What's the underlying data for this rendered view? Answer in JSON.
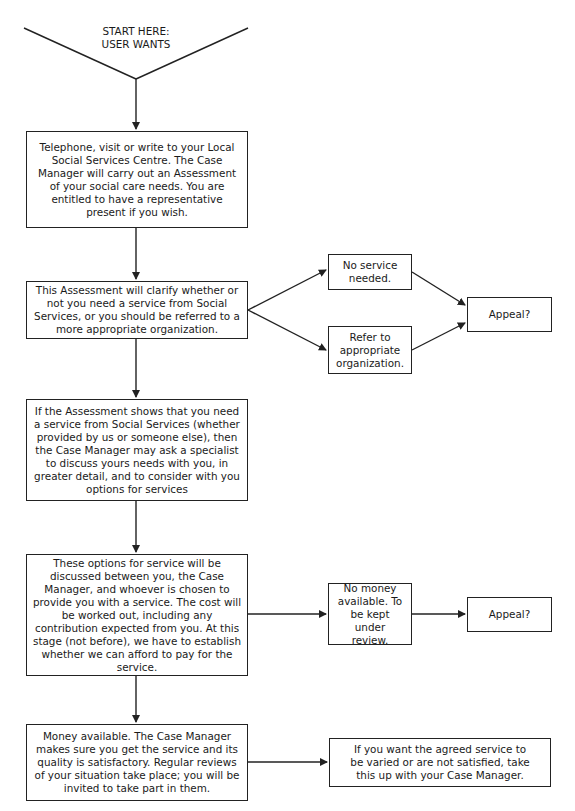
{
  "start": {
    "line1": "START HERE:",
    "line2": "USER WANTS"
  },
  "main_flow": [
    {
      "id": "contact",
      "text": "Telephone, visit or write to your Local Social Services Centre. The Case Manager will carry out an Assessment of your social care needs. You are entitled to have a representative present if you wish."
    },
    {
      "id": "assessment",
      "text": "This Assessment will clarify whether or not you need a service from Social Services, or you should be referred to a more appropriate organization."
    },
    {
      "id": "specialist",
      "text": "If the Assessment shows that you need a service from Social Services (whether provided by us or someone else), then the Case Manager may ask a specialist to discuss yours needs with you, in greater detail, and to consider with you options for services"
    },
    {
      "id": "options",
      "text": "These options for service will be discussed between you, the Case Manager, and whoever is chosen to provide you with a service. The cost will be worked out, including any contribution expected from you. At this stage (not before), we have to establish whether we can afford to pay for the service."
    },
    {
      "id": "money_available",
      "text": "Money available. The Case Manager makes sure you get the service and its quality is satisfactory. Regular reviews of your situation take place; you will be invited to take part in them."
    }
  ],
  "branches": {
    "no_service": "No service needed.",
    "refer": "Refer to appropriate organization.",
    "appeal_1": "Appeal?",
    "no_money": "No money available. To be kept under review.",
    "appeal_2": "Appeal?",
    "vary_service": "If you want the agreed service to be varied or are not satisfied, take this up with your Case Manager."
  },
  "colors": {
    "line": "#222222",
    "background": "#ffffff",
    "text": "#1a1a1a"
  }
}
